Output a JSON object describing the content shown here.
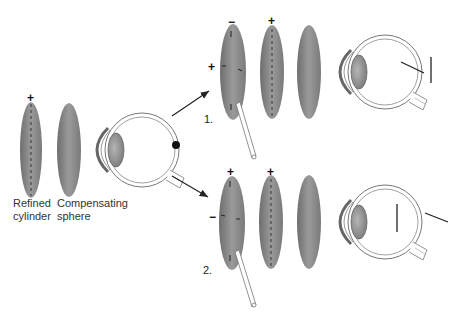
{
  "labels": {
    "refined_cylinder": [
      "Refined",
      "cylinder"
    ],
    "compensating_sphere": [
      "Compensating",
      "sphere"
    ],
    "step1": "1.",
    "step2": "2."
  },
  "signs": {
    "initial_cylinder_axis": "+",
    "step1_flip_top": "−",
    "step1_flip_left": "+",
    "step1_cyl": "+",
    "step2_flip_top": "+",
    "step2_flip_left": "−",
    "step2_cyl": "+"
  },
  "colors": {
    "lens_gray": "#8a8a8a",
    "outline": "#555555",
    "background": "#ffffff"
  }
}
